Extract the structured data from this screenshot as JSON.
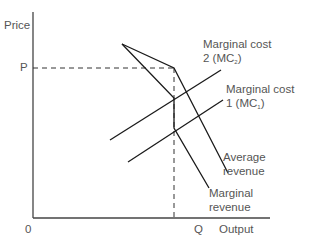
{
  "diagram": {
    "axes": {
      "y_label": "Price",
      "x_label": "Output",
      "origin_label": "0",
      "price_marker": "P",
      "quantity_marker": "Q"
    },
    "curves": {
      "mc2": {
        "line1": "Marginal cost",
        "line2_prefix": "2 (MC",
        "line2_sub": "2",
        "line2_suffix": ")"
      },
      "mc1": {
        "line1": "Marginal cost",
        "line2_prefix": "1 (MC",
        "line2_sub": "1",
        "line2_suffix": ")"
      },
      "ar": {
        "line1": "Average",
        "line2": "revenue"
      },
      "mr": {
        "line1": "Marginal",
        "line2": "revenue"
      }
    },
    "colors": {
      "line": "#1a1a1a",
      "axis": "#444444",
      "text": "#555555"
    }
  }
}
